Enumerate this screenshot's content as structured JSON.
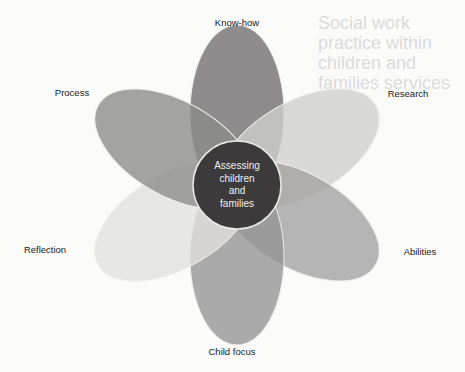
{
  "diagram": {
    "center": {
      "lines": [
        "Assessing",
        "children",
        "and",
        "families"
      ],
      "color": "#3c3a3b"
    },
    "petals": [
      {
        "id": "know-how",
        "label": "Know-how",
        "angle": 0,
        "color": "#6f6d6e",
        "label_pos": [
          237,
          22
        ]
      },
      {
        "id": "research",
        "label": "Research",
        "angle": 60,
        "color": "#cfcfcd",
        "label_pos": [
          408,
          93
        ]
      },
      {
        "id": "abilities",
        "label": "Abilities",
        "angle": 120,
        "color": "#a3a2a1",
        "label_pos": [
          420,
          251
        ]
      },
      {
        "id": "child-focus",
        "label": "Child focus",
        "angle": 180,
        "color": "#959493",
        "label_pos": [
          232,
          351
        ]
      },
      {
        "id": "reflection",
        "label": "Reflection",
        "angle": 240,
        "color": "#e2e2e0",
        "label_pos": [
          45,
          249
        ]
      },
      {
        "id": "process",
        "label": "Process",
        "angle": 300,
        "color": "#8b8a89",
        "label_pos": [
          72,
          92
        ]
      }
    ]
  },
  "background_bleed": {
    "heading": "Social work practice within children and families services"
  }
}
